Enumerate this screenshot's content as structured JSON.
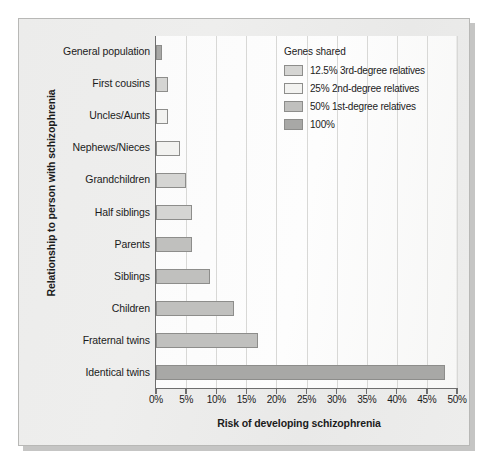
{
  "chart_data": {
    "type": "bar",
    "orientation": "horizontal",
    "title": "",
    "xlabel": "Risk of developing schizophrenia",
    "ylabel": "Relationship to person with schizophrenia",
    "xlim": [
      0,
      50
    ],
    "xunit": "%",
    "grid": true,
    "xticks": [
      "0%",
      "5%",
      "10%",
      "15%",
      "20%",
      "25%",
      "30%",
      "35%",
      "40%",
      "45%",
      "50%"
    ],
    "xtick_values": [
      0,
      5,
      10,
      15,
      20,
      25,
      30,
      35,
      40,
      45,
      50
    ],
    "categories": [
      "General population",
      "First cousins",
      "Uncles/Aunts",
      "Nephews/Nieces",
      "Grandchildren",
      "Half siblings",
      "Parents",
      "Siblings",
      "Children",
      "Fraternal twins",
      "Identical twins"
    ],
    "values": [
      1,
      2,
      2,
      4,
      5,
      6,
      6,
      9,
      13,
      17,
      48
    ],
    "group_index": [
      3,
      0,
      1,
      1,
      0,
      0,
      2,
      2,
      2,
      2,
      3
    ],
    "legend": {
      "title": "Genes shared",
      "position": "top-right",
      "entries": [
        {
          "label": "12.5% 3rd-degree relatives",
          "color": "#d5d5d3"
        },
        {
          "label": "25% 2nd-degree relatives",
          "color": "#f2f2f0"
        },
        {
          "label": "50% 1st-degree relatives",
          "color": "#c0c0be"
        },
        {
          "label": "100%",
          "color": "#a8a8a6"
        }
      ]
    }
  }
}
